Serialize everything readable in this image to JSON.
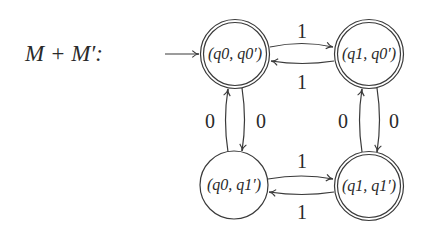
{
  "diagram": {
    "type": "finite-automaton",
    "title": "M + M′:",
    "start_state": "q0q0",
    "colors": {
      "stroke": "#3a3a3a",
      "text": "#2a2a2a",
      "background": "#ffffff"
    },
    "states": {
      "q0q0": {
        "label": "(q0, q0′)",
        "accepting": true,
        "cx": 235,
        "cy": 54
      },
      "q1q0": {
        "label": "(q1, q0′)",
        "accepting": true,
        "cx": 369,
        "cy": 54
      },
      "q0q1": {
        "label": "(q0, q1′)",
        "accepting": false,
        "cx": 234,
        "cy": 185
      },
      "q1q1": {
        "label": "(q1, q1′)",
        "accepting": true,
        "cx": 369,
        "cy": 186
      }
    },
    "transitions": {
      "q0q0_to_q1q0": {
        "from": "(q0, q0′)",
        "to": "(q1, q0′)",
        "symbol": "1"
      },
      "q1q0_to_q0q0": {
        "from": "(q1, q0′)",
        "to": "(q0, q0′)",
        "symbol": "1"
      },
      "q0q1_to_q1q1": {
        "from": "(q0, q1′)",
        "to": "(q1, q1′)",
        "symbol": "1"
      },
      "q1q1_to_q0q1": {
        "from": "(q1, q1′)",
        "to": "(q0, q1′)",
        "symbol": "1"
      },
      "q0q1_to_q0q0": {
        "from": "(q0, q1′)",
        "to": "(q0, q0′)",
        "symbol": "0"
      },
      "q0q0_to_q0q1": {
        "from": "(q0, q0′)",
        "to": "(q0, q1′)",
        "symbol": "0"
      },
      "q1q1_to_q1q0": {
        "from": "(q1, q1′)",
        "to": "(q1, q0′)",
        "symbol": "0"
      },
      "q1q0_to_q1q1": {
        "from": "(q1, q0′)",
        "to": "(q1, q1′)",
        "symbol": "0"
      }
    }
  }
}
